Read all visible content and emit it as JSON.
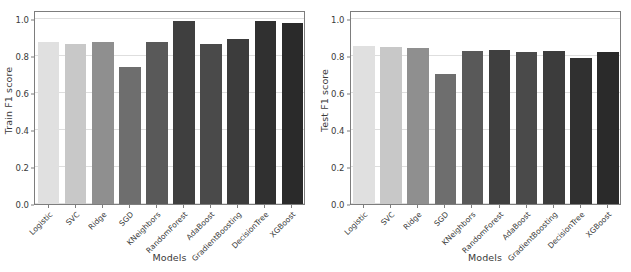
{
  "figure": {
    "background": "#ffffff",
    "frame_color": "#7d7d7d",
    "grid_color": "#dedede",
    "text_color": "#3a3a3a"
  },
  "chart_data": [
    {
      "type": "bar",
      "title": "",
      "xlabel": "Models",
      "ylabel": "Train F1 score",
      "categories": [
        "Logistic",
        "SVC",
        "Ridge",
        "SGD",
        "KNeighbors",
        "RandomForest",
        "AdaBoost",
        "GradientBoosting",
        "DecisionTree",
        "XGBoost"
      ],
      "values": [
        0.875,
        0.865,
        0.878,
        0.742,
        0.875,
        0.991,
        0.866,
        0.893,
        0.99,
        0.98
      ],
      "ylim": [
        0.0,
        1.05
      ],
      "yticks": [
        0.0,
        0.2,
        0.4,
        0.6,
        0.8,
        1.0
      ],
      "yticklabels": [
        "0.0",
        "0.2",
        "0.4",
        "0.6",
        "0.8",
        "1.0"
      ],
      "grid": true,
      "legend": "none",
      "bar_colors": [
        "#e0e0e0",
        "#c8c8c8",
        "#8f8f8f",
        "#6e6e6e",
        "#595959",
        "#3f3f3f",
        "#4a4a4a",
        "#3c3c3c",
        "#303030",
        "#2a2a2a"
      ]
    },
    {
      "type": "bar",
      "title": "",
      "xlabel": "Models",
      "ylabel": "Test F1 score",
      "categories": [
        "Logistic",
        "SVC",
        "Ridge",
        "SGD",
        "KNeighbors",
        "RandomForest",
        "AdaBoost",
        "GradientBoosting",
        "DecisionTree",
        "XGBoost"
      ],
      "values": [
        0.855,
        0.849,
        0.843,
        0.701,
        0.826,
        0.836,
        0.821,
        0.826,
        0.789,
        0.824
      ],
      "ylim": [
        0.0,
        1.05
      ],
      "yticks": [
        0.0,
        0.2,
        0.4,
        0.6,
        0.8,
        1.0
      ],
      "yticklabels": [
        "0.0",
        "0.2",
        "0.4",
        "0.6",
        "0.8",
        "1.0"
      ],
      "grid": true,
      "legend": "none",
      "bar_colors": [
        "#e0e0e0",
        "#c8c8c8",
        "#8f8f8f",
        "#6e6e6e",
        "#595959",
        "#3f3f3f",
        "#4a4a4a",
        "#3c3c3c",
        "#303030",
        "#2a2a2a"
      ]
    }
  ]
}
